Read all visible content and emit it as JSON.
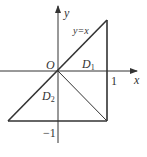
{
  "diagram": {
    "axes": {
      "x_label": "x",
      "y_label": "y",
      "origin_label": "O"
    },
    "ticks": {
      "x_one": "1",
      "y_neg_one": "−1"
    },
    "line_label": "y=x",
    "regions": [
      {
        "name": "D",
        "sub": "1"
      },
      {
        "name": "D",
        "sub": "2"
      }
    ],
    "colors": {
      "stroke": "#333333",
      "background": "#ffffff"
    }
  }
}
